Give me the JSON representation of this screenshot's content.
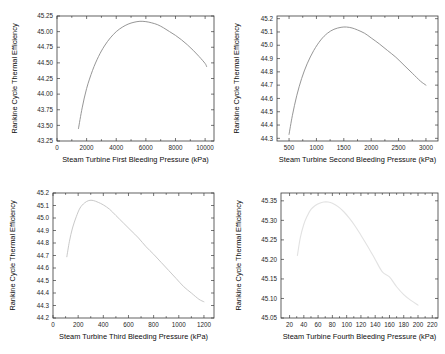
{
  "figure": {
    "background": "#ffffff",
    "axis_color": "#3b3b3b",
    "shared_ylabel": "Rankine Cycle Thermal Efficiency"
  },
  "chart_data": [
    {
      "type": "line",
      "title": "",
      "xlabel": "Steam Turbine First Bleeding Pressure (kPa)",
      "ylabel": "Rankine Cycle Thermal Efficiency",
      "xlim": [
        0,
        10600
      ],
      "ylim": [
        43.25,
        45.25
      ],
      "xticks": [
        0,
        2000,
        4000,
        6000,
        8000,
        10000
      ],
      "xticklabels": [
        "0",
        "2000",
        "4000",
        "6000",
        "8000",
        "10000"
      ],
      "yticks": [
        43.25,
        43.5,
        43.75,
        44.0,
        44.25,
        44.5,
        44.75,
        45.0,
        45.25
      ],
      "yticklabels": [
        "43.25",
        "43.50",
        "43.75",
        "44.00",
        "44.25",
        "44.50",
        "44.75",
        "45.00",
        "45.25"
      ],
      "grid": false,
      "legend": null,
      "line_color": "#8a8a8a",
      "line_width": 0.9,
      "x": [
        1450,
        1700,
        2000,
        2400,
        2800,
        3200,
        3600,
        4000,
        4400,
        4800,
        5200,
        5600,
        6000,
        6400,
        6800,
        7200,
        7600,
        8000,
        8400,
        8800,
        9200,
        9600,
        10000,
        10100
      ],
      "y": [
        43.45,
        43.78,
        44.09,
        44.38,
        44.6,
        44.77,
        44.9,
        45.0,
        45.07,
        45.12,
        45.15,
        45.165,
        45.16,
        45.14,
        45.11,
        45.06,
        45.0,
        44.94,
        44.87,
        44.79,
        44.7,
        44.6,
        44.49,
        44.44
      ]
    },
    {
      "type": "line",
      "title": "",
      "xlabel": "Steam Turbine Second Bleeding Pressure (kPa)",
      "ylabel": "Rankine Cycle Thermal Efficiency",
      "xlim": [
        280,
        3220
      ],
      "ylim": [
        44.28,
        45.22
      ],
      "xticks": [
        500,
        1000,
        1500,
        2000,
        2500,
        3000
      ],
      "xticklabels": [
        "500",
        "1000",
        "1500",
        "2000",
        "2500",
        "3000"
      ],
      "yticks": [
        44.3,
        44.4,
        44.5,
        44.6,
        44.7,
        44.8,
        44.9,
        45.0,
        45.1,
        45.2
      ],
      "yticklabels": [
        "44.3",
        "44.4",
        "44.5",
        "44.6",
        "44.7",
        "44.8",
        "44.9",
        "45.0",
        "45.1",
        "45.2"
      ],
      "grid": false,
      "legend": null,
      "line_color": "#8a8a8a",
      "line_width": 0.9,
      "x": [
        500,
        560,
        640,
        730,
        830,
        950,
        1080,
        1200,
        1320,
        1450,
        1550,
        1650,
        1750,
        1880,
        2000,
        2150,
        2300,
        2450,
        2600,
        2750,
        2900,
        3000
      ],
      "y": [
        44.33,
        44.47,
        44.62,
        44.75,
        44.86,
        44.96,
        45.04,
        45.09,
        45.12,
        45.135,
        45.137,
        45.13,
        45.115,
        45.09,
        45.055,
        45.01,
        44.96,
        44.91,
        44.85,
        44.79,
        44.73,
        44.7
      ]
    },
    {
      "type": "line",
      "title": "",
      "xlabel": "Steam Turbine Third Bleeding Pressure (kPa)",
      "ylabel": "Rankine Cycle Thermal Efficiency",
      "xlim": [
        0,
        1280
      ],
      "ylim": [
        44.2,
        45.2
      ],
      "xticks": [
        0,
        200,
        400,
        600,
        800,
        1000,
        1200
      ],
      "xticklabels": [
        "0",
        "200",
        "400",
        "600",
        "800",
        "1000",
        "1200"
      ],
      "yticks": [
        44.2,
        44.3,
        44.4,
        44.5,
        44.6,
        44.7,
        44.8,
        44.9,
        45.0,
        45.1,
        45.2
      ],
      "yticklabels": [
        "44.2",
        "44.3",
        "44.4",
        "44.5",
        "44.6",
        "44.7",
        "44.8",
        "44.9",
        "45.0",
        "45.1",
        "45.2"
      ],
      "grid": false,
      "legend": null,
      "line_color": "#c9c9c9",
      "line_width": 1.0,
      "x": [
        110,
        130,
        155,
        185,
        215,
        250,
        285,
        320,
        360,
        400,
        450,
        500,
        560,
        620,
        680,
        740,
        800,
        860,
        920,
        980,
        1040,
        1100,
        1160,
        1200
      ],
      "y": [
        44.69,
        44.81,
        44.92,
        45.01,
        45.08,
        45.12,
        45.14,
        45.14,
        45.125,
        45.105,
        45.07,
        45.02,
        44.96,
        44.9,
        44.84,
        44.77,
        44.71,
        44.645,
        44.58,
        44.515,
        44.45,
        44.4,
        44.35,
        44.33
      ]
    },
    {
      "type": "line",
      "title": "",
      "xlabel": "Steam Turbine Fourth Bleeding Pressure (kPa)",
      "ylabel": "Rankine Cycle Thermal Efficiency",
      "xlim": [
        8,
        228
      ],
      "ylim": [
        45.05,
        45.37
      ],
      "xticks": [
        20,
        40,
        60,
        80,
        100,
        120,
        140,
        160,
        180,
        200,
        220
      ],
      "xticklabels": [
        "20",
        "40",
        "60",
        "80",
        "100",
        "120",
        "140",
        "160",
        "180",
        "200",
        "220"
      ],
      "yticks": [
        45.05,
        45.1,
        45.15,
        45.2,
        45.25,
        45.3,
        45.35
      ],
      "yticklabels": [
        "45.05",
        "45.10",
        "45.15",
        "45.20",
        "45.25",
        "45.30",
        "45.35"
      ],
      "grid": false,
      "legend": null,
      "line_color": "#e2e2e2",
      "line_width": 1.1,
      "x": [
        31,
        35,
        40,
        45,
        50,
        56,
        62,
        68,
        74,
        80,
        88,
        96,
        104,
        112,
        120,
        130,
        140,
        150,
        160,
        170,
        180,
        190,
        200
      ],
      "y": [
        45.21,
        45.255,
        45.29,
        45.312,
        45.328,
        45.338,
        45.344,
        45.347,
        45.347,
        45.344,
        45.335,
        45.322,
        45.305,
        45.285,
        45.262,
        45.232,
        45.2,
        45.168,
        45.155,
        45.13,
        45.11,
        45.095,
        45.083
      ]
    }
  ]
}
